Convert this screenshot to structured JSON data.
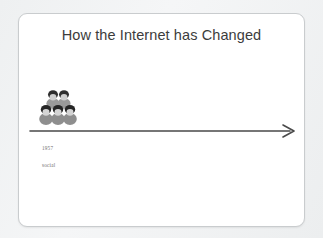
{
  "slide": {
    "title": "How the Internet has Changed",
    "background_color": "#f2f3f4",
    "card_color": "#ffffff",
    "border_color": "#c9ccce",
    "title_color": "#3c3c3c"
  },
  "graphic": {
    "people_icon": "people-group-icon",
    "people_count": 5,
    "people_color": "#8c8c8c",
    "hair_color": "#2b2b2b"
  },
  "timeline": {
    "arrow_icon": "right-arrow-icon",
    "arrow_color": "#4a4a4a",
    "direction": "right",
    "events": [
      {
        "year": "1957",
        "label": "social"
      }
    ]
  }
}
